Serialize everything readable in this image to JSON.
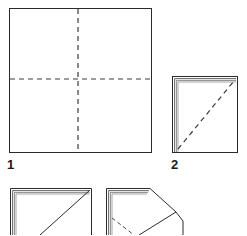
{
  "figure": {
    "kind": "instructional-line-diagram",
    "background_color": "#ffffff",
    "ink_color": "#2b2b2b",
    "fold_line_color": "#3a3a3a",
    "layered_edge_color": "#555555"
  },
  "steps": [
    {
      "number": "1",
      "name": "flat-square-with-creases",
      "caption": "1",
      "shape": "square",
      "solid_outline": [
        [
          9,
          8
        ],
        [
          152,
          8
        ],
        [
          152,
          153
        ],
        [
          9,
          153
        ]
      ],
      "dashed_lines": [
        {
          "name": "vertical-crease",
          "from": [
            78,
            9
          ],
          "to": [
            78,
            152
          ]
        },
        {
          "name": "horizontal-crease",
          "from": [
            10,
            79
          ],
          "to": [
            151,
            79
          ]
        }
      ]
    },
    {
      "number": "2",
      "name": "folded-square-with-diagonal-crease",
      "caption": "2",
      "shape": "square",
      "solid_outline": [
        [
          172,
          76
        ],
        [
          238,
          76
        ],
        [
          238,
          153
        ],
        [
          172,
          153
        ]
      ],
      "layered_edges": [
        "top",
        "left"
      ],
      "layer_count": 3,
      "dashed_lines": [
        {
          "name": "diagonal-crease",
          "from": [
            178,
            149
          ],
          "to": [
            234,
            81
          ]
        }
      ]
    },
    {
      "number": "3",
      "name": "square-with-solid-diagonal-fold",
      "caption": "",
      "shape": "square",
      "solid_outline": [
        [
          10,
          188
        ],
        [
          92,
          188
        ],
        [
          92,
          235
        ],
        [
          10,
          235
        ]
      ],
      "layered_edges": [
        "top",
        "left"
      ],
      "layer_count": 3,
      "solid_lines": [
        {
          "name": "diagonal-fold",
          "from": [
            90,
            190
          ],
          "to": [
            40,
            235
          ]
        }
      ]
    },
    {
      "number": "4",
      "name": "square-with-corner-flap-folded-out",
      "caption": "",
      "shape": "square-with-flap",
      "solid_outline": [
        [
          106,
          188
        ],
        [
          150,
          188
        ],
        [
          150,
          235
        ],
        [
          106,
          235
        ]
      ],
      "layered_edges": [
        "top",
        "left"
      ],
      "layer_count": 3,
      "solid_lines": [
        {
          "name": "flap-upper-edge",
          "from": [
            150,
            188
          ],
          "to": [
            176,
            212
          ]
        },
        {
          "name": "flap-lower-edge",
          "from": [
            176,
            212
          ],
          "to": [
            183,
            221
          ]
        },
        {
          "name": "flap-right-edge",
          "from": [
            183,
            221
          ],
          "to": [
            183,
            235
          ]
        },
        {
          "name": "flap-inner-fold",
          "from": [
            176,
            212
          ],
          "to": [
            139,
            235
          ]
        }
      ],
      "dashed_lines": [
        {
          "name": "inner-crease-hint",
          "from": [
            112,
            218
          ],
          "to": [
            134,
            235
          ]
        }
      ]
    }
  ]
}
